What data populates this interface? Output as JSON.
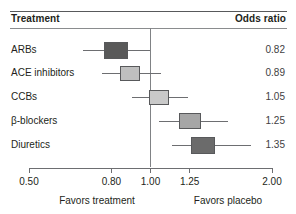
{
  "header": {
    "treatment_label": "Treatment",
    "odds_ratio_label": "Odds ratio"
  },
  "footer": {
    "left_label": "Favors treatment",
    "right_label": "Favors placebo"
  },
  "chart_data": {
    "type": "forest",
    "title": "",
    "xlabel": "",
    "ylabel": "",
    "xscale": "log",
    "xlim": [
      0.5,
      2.0
    ],
    "reference_line": 1.0,
    "grid": false,
    "legend": "none",
    "columns": [
      "Treatment",
      "Odds ratio"
    ],
    "tick_values": [
      0.5,
      0.8,
      1.0,
      1.25,
      2.0
    ],
    "tick_labels": [
      "0.50",
      "0.80",
      "1.00",
      "1.25",
      "2.00"
    ],
    "footnote_left": "Favors treatment",
    "footnote_right": "Favors placebo",
    "categories": [
      "ARBs",
      "ACE inhibitors",
      "CCBs",
      "β-blockers",
      "Diuretics"
    ],
    "values": [
      0.82,
      0.89,
      1.05,
      1.25,
      1.35
    ],
    "value_labels": [
      "0.82",
      "0.89",
      "1.05",
      "1.25",
      "1.35"
    ],
    "ci_low": [
      0.68,
      0.76,
      0.9,
      1.05,
      1.13
    ],
    "ci_high": [
      1.0,
      1.06,
      1.24,
      1.56,
      1.77
    ],
    "marker_colors": [
      "#595959",
      "#bfbfbf",
      "#c9c9c9",
      "#a6a6a6",
      "#6b6b6b"
    ],
    "rows": [
      {
        "label": "ARBs",
        "value": "0.82",
        "point": 0.82,
        "low": 0.68,
        "high": 1.0,
        "color": "#595959"
      },
      {
        "label": "ACE inhibitors",
        "value": "0.89",
        "point": 0.89,
        "low": 0.76,
        "high": 1.06,
        "color": "#bfbfbf"
      },
      {
        "label": "CCBs",
        "value": "1.05",
        "point": 1.05,
        "low": 0.9,
        "high": 1.24,
        "color": "#c9c9c9"
      },
      {
        "label": "β-blockers",
        "value": "1.25",
        "point": 1.25,
        "low": 1.05,
        "high": 1.56,
        "color": "#a6a6a6"
      },
      {
        "label": "Diuretics",
        "value": "1.35",
        "point": 1.35,
        "low": 1.13,
        "high": 1.77,
        "color": "#6b6b6b"
      }
    ]
  },
  "colors": {
    "rule": "#58595b",
    "line": "#6d6e71",
    "text": "#231f20",
    "background": "#ffffff"
  }
}
